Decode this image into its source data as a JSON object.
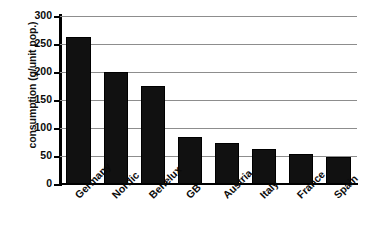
{
  "chart_data": {
    "type": "bar",
    "title": "",
    "subtitle": "",
    "xlabel": "",
    "ylabel": "consumption (g/unit pop.)",
    "categories": [
      "Germany",
      "Nordic",
      "Benelux",
      "GB",
      "Austria",
      "Italy",
      "France",
      "Spain"
    ],
    "values": [
      262,
      200,
      175,
      84,
      74,
      62,
      54,
      48
    ],
    "series": [
      {
        "name": "consumption",
        "values": [
          262,
          200,
          175,
          84,
          74,
          62,
          54,
          48
        ]
      }
    ],
    "ylim": [
      0,
      300
    ],
    "ytick_labels": [
      "300",
      "250",
      "200",
      "150",
      "100",
      "50",
      "0"
    ],
    "ytick_values": [
      300,
      250,
      200,
      150,
      100,
      50,
      0
    ],
    "grid": true,
    "grid_axis": "y",
    "legend": false,
    "legend_position": "none",
    "bar_color": "#111111",
    "grid_color": "#8d8d8d",
    "axis_color": "#000000",
    "background_color": "#ffffff",
    "xtick_label_rotation": "-45"
  }
}
